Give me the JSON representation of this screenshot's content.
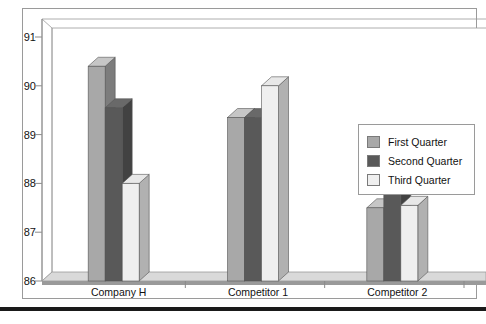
{
  "chart_data": {
    "type": "bar",
    "title": "",
    "subtitle": "",
    "xlabel": "",
    "ylabel": "",
    "categories": [
      "Company H",
      "Competitor 1",
      "Competitor 2"
    ],
    "series": [
      {
        "name": "First Quarter",
        "values": [
          90.4,
          89.35,
          87.5
        ],
        "color": "#a8a8a8"
      },
      {
        "name": "Second Quarter",
        "values": [
          89.55,
          89.35,
          88.0
        ],
        "color": "#595959"
      },
      {
        "name": "Third Quarter",
        "values": [
          88.0,
          90.0,
          87.55
        ],
        "color": "#efefef"
      }
    ],
    "ylim": [
      86,
      91
    ],
    "yticks": [
      86,
      87,
      88,
      89,
      90,
      91
    ],
    "ytick_labels": [
      "86",
      "87",
      "88",
      "89",
      "90",
      "91"
    ],
    "grid": false,
    "legend_position": "right",
    "three_d": true,
    "annotations": []
  },
  "legend": {
    "items": [
      {
        "label": "First Quarter",
        "swatch": "#a8a8a8"
      },
      {
        "label": "Second Quarter",
        "swatch": "#595959"
      },
      {
        "label": "Third Quarter",
        "swatch": "#efefef"
      }
    ]
  },
  "colors": {
    "plot_background": "#ffffff",
    "axis_line": "#8a8a8a",
    "floor_top": "#d9d9d9",
    "floor_front": "#9a9a9a",
    "border": "#8a8a8a",
    "bar_side_dark": "#7b7b7b",
    "bar_top_dark": "#c2c2c2",
    "text": "#111111"
  },
  "frame": {
    "bottom_rule": true
  }
}
